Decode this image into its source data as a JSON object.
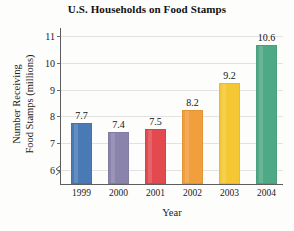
{
  "chart_data": {
    "type": "bar",
    "title": "U.S. Households on Food Stamps",
    "xlabel": "Year",
    "ylabel_lines": [
      "Number Receiving",
      "Food Stamps (millions)"
    ],
    "ylabel": "Number Receiving Food Stamps (millions)",
    "categories": [
      "1999",
      "2000",
      "2001",
      "2002",
      "2003",
      "2004"
    ],
    "values": [
      7.7,
      7.4,
      7.5,
      8.2,
      9.2,
      10.6
    ],
    "value_labels": [
      "7.7",
      "7.4",
      "7.5",
      "8.2",
      "9.2",
      "10.6"
    ],
    "ylim": [
      5.45,
      11.25
    ],
    "yticks": [
      6,
      7,
      8,
      9,
      10,
      11
    ],
    "ytick_labels": [
      "6",
      "7",
      "8",
      "9",
      "10",
      "11"
    ],
    "grid": true,
    "axis_break": true,
    "legend": false,
    "bar_colors": [
      "#4a7ab5",
      "#8a84ad",
      "#e24a4f",
      "#f09f3c",
      "#f5c732",
      "#4fa886"
    ]
  }
}
